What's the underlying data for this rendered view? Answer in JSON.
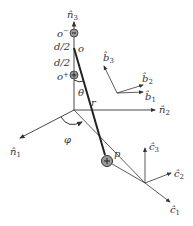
{
  "diagram": {
    "axes": {
      "n3": "n̂",
      "n3_sub": "3",
      "n2": "n̂",
      "n2_sub": "2",
      "n1": "n̂",
      "n1_sub": "1"
    },
    "charges": {
      "minus_label": "o",
      "minus_sup": "−",
      "plus_label": "o",
      "plus_sup": "+",
      "half_sep_upper": "d/2",
      "half_sep_lower": "d/2",
      "center": "o"
    },
    "angles": {
      "theta": "θ",
      "phi": "φ"
    },
    "radius": "r",
    "point": "p",
    "b_frame": {
      "b3": "b̂",
      "b3_sub": "3",
      "b2": "b̂",
      "b2_sub": "2",
      "b1": "b̂",
      "b1_sub": "1"
    },
    "c_frame": {
      "c3": "ĉ",
      "c3_sub": "3",
      "c2": "ĉ",
      "c2_sub": "2",
      "c1": "ĉ",
      "c1_sub": "1"
    },
    "colors": {
      "line": "#333333",
      "charge_fill": "#9a9a9a"
    }
  }
}
